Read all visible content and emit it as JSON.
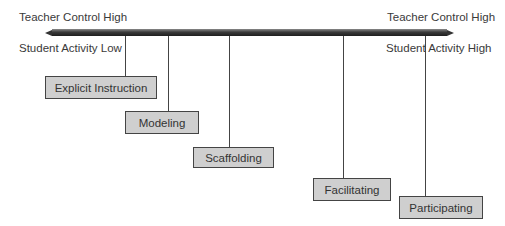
{
  "axis": {
    "left_top": "Teacher Control High",
    "left_bottom": "Student Activity Low",
    "right_top": "Teacher Control High",
    "right_bottom": "Student Activity High"
  },
  "stages": [
    {
      "label": "Explicit Instruction"
    },
    {
      "label": "Modeling"
    },
    {
      "label": "Scaffolding"
    },
    {
      "label": "Facilitating"
    },
    {
      "label": "Participating"
    }
  ],
  "colors": {
    "box_fill": "#cfcfcf",
    "bar": "#333333"
  }
}
